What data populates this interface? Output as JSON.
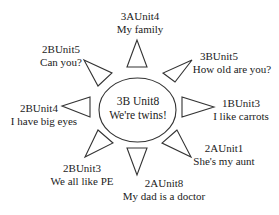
{
  "center": {
    "unit": "3B Unit8",
    "title": "We're twins!"
  },
  "rays": [
    {
      "position": "top",
      "unit": "3AUnit4",
      "title": "My family"
    },
    {
      "position": "upper-left",
      "unit": "2BUnit5",
      "title": "Can you?"
    },
    {
      "position": "upper-right",
      "unit": "3BUnit5",
      "title": "How old are you?"
    },
    {
      "position": "left",
      "unit": "2BUnit4",
      "title": "I have big eyes"
    },
    {
      "position": "right",
      "unit": "1BUnit3",
      "title": "I like carrots"
    },
    {
      "position": "lower-left",
      "unit": "2BUnit3",
      "title": "We all like PE"
    },
    {
      "position": "lower-right",
      "unit": "2AUnit1",
      "title": "She's my aunt"
    },
    {
      "position": "bottom",
      "unit": "2AUnit8",
      "title": "My dad is a doctor"
    }
  ],
  "colors": {
    "stroke": "#333333",
    "text": "#222222",
    "background": "#ffffff"
  }
}
